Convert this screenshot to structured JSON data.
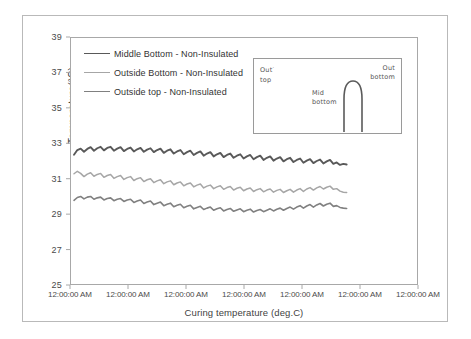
{
  "chart_data": {
    "type": "line",
    "title": "",
    "xlabel": "Curing temperature  (deg.C)",
    "ylabel": "Temperature(°C)",
    "ylim": [
      25,
      39
    ],
    "yticks": [
      25,
      27,
      29,
      31,
      33,
      35,
      37,
      39
    ],
    "xticks": [
      "12:00:00 AM",
      "12:00:00 AM",
      "12:00:00 AM",
      "12:00:00 AM",
      "12:00:00 AM",
      "12:00:00 AM",
      "12:00:00 AM"
    ],
    "grid": false,
    "legend_position": "upper left",
    "series": [
      {
        "name": "Middle Bottom - Non-Insulated",
        "color": "#595959",
        "width": 1.9,
        "values": [
          32.35,
          32.62,
          32.7,
          32.52,
          32.68,
          32.78,
          32.58,
          32.72,
          32.8,
          32.6,
          32.74,
          32.8,
          32.58,
          32.7,
          32.78,
          32.56,
          32.68,
          32.76,
          32.54,
          32.66,
          32.74,
          32.52,
          32.64,
          32.72,
          32.5,
          32.62,
          32.7,
          32.46,
          32.58,
          32.66,
          32.42,
          32.54,
          32.62,
          32.38,
          32.5,
          32.58,
          32.34,
          32.46,
          32.54,
          32.3,
          32.42,
          32.5,
          32.26,
          32.38,
          32.46,
          32.22,
          32.34,
          32.42,
          32.18,
          32.3,
          32.38,
          32.14,
          32.26,
          32.34,
          32.1,
          32.22,
          32.3,
          32.06,
          32.18,
          32.26,
          32.02,
          32.14,
          32.22,
          31.98,
          32.1,
          32.18,
          31.94,
          32.06,
          32.14,
          31.9,
          32.02,
          32.1,
          31.88,
          32.0,
          32.08,
          31.86,
          31.98,
          32.06,
          31.84,
          31.92,
          31.78,
          31.84,
          31.8
        ]
      },
      {
        "name": "Outside Bottom - Non-Insulated",
        "color": "#a6a6a6",
        "width": 1.5,
        "values": [
          31.28,
          31.42,
          31.3,
          31.12,
          31.26,
          31.34,
          31.14,
          31.24,
          31.3,
          31.08,
          31.18,
          31.24,
          31.02,
          31.12,
          31.18,
          30.96,
          31.06,
          31.12,
          30.9,
          31.0,
          31.06,
          30.84,
          30.94,
          31.0,
          30.78,
          30.88,
          30.94,
          30.72,
          30.82,
          30.88,
          30.66,
          30.76,
          30.82,
          30.6,
          30.7,
          30.76,
          30.54,
          30.64,
          30.7,
          30.48,
          30.58,
          30.64,
          30.44,
          30.54,
          30.6,
          30.4,
          30.5,
          30.56,
          30.36,
          30.46,
          30.52,
          30.32,
          30.42,
          30.48,
          30.28,
          30.38,
          30.44,
          30.26,
          30.36,
          30.42,
          30.24,
          30.34,
          30.4,
          30.22,
          30.32,
          30.4,
          30.24,
          30.36,
          30.44,
          30.28,
          30.42,
          30.5,
          30.36,
          30.48,
          30.56,
          30.42,
          30.52,
          30.58,
          30.4,
          30.44,
          30.3,
          30.24,
          30.22
        ]
      },
      {
        "name": "Outside top - Non-Insulated",
        "color": "#808080",
        "width": 1.6,
        "values": [
          29.78,
          29.94,
          30.0,
          29.86,
          29.96,
          30.0,
          29.84,
          29.92,
          29.96,
          29.8,
          29.88,
          29.92,
          29.76,
          29.84,
          29.88,
          29.72,
          29.8,
          29.84,
          29.66,
          29.74,
          29.8,
          29.6,
          29.68,
          29.74,
          29.54,
          29.62,
          29.68,
          29.48,
          29.56,
          29.62,
          29.42,
          29.5,
          29.56,
          29.36,
          29.44,
          29.5,
          29.3,
          29.38,
          29.44,
          29.26,
          29.34,
          29.4,
          29.22,
          29.3,
          29.36,
          29.18,
          29.26,
          29.32,
          29.16,
          29.24,
          29.3,
          29.14,
          29.22,
          29.28,
          29.12,
          29.2,
          29.26,
          29.14,
          29.22,
          29.3,
          29.18,
          29.28,
          29.34,
          29.22,
          29.32,
          29.4,
          29.28,
          29.4,
          29.48,
          29.34,
          29.46,
          29.54,
          29.4,
          29.52,
          29.6,
          29.46,
          29.56,
          29.62,
          29.44,
          29.48,
          29.38,
          29.34,
          29.32
        ]
      }
    ]
  },
  "legend": {
    "items": [
      {
        "label": "Middle Bottom - Non-Insulated"
      },
      {
        "label": "Outside Bottom - Non-Insulated"
      },
      {
        "label": "Outside top - Non-Insulated"
      }
    ]
  },
  "inset": {
    "out_top": "Out",
    "out_top_mark": "·",
    "out_top_second": "top",
    "out_bottom": "Out",
    "out_bottom_second": "bottom",
    "mid_bottom": "Mid",
    "mid_bottom_second": "bottom"
  }
}
